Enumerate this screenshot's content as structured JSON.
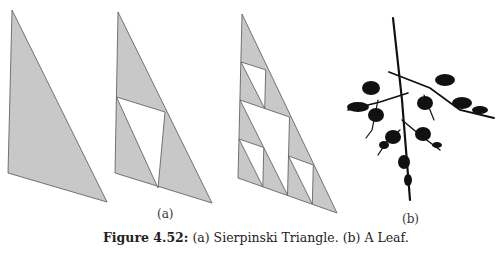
{
  "figure": {
    "number_label": "Figure 4.52:",
    "caption_text": "(a) Sierpinski Triangle. (b) A Leaf.",
    "panels": [
      {
        "label": "(a)",
        "description": "Sierpinski triangle iterations 0, 1, 2 on a right triangle",
        "iterations": [
          0,
          1,
          2
        ],
        "fill_color": "#c8c8c8",
        "hole_color": "#ffffff"
      },
      {
        "label": "(b)",
        "description": "Fractal leaf (IFS) rendered in black",
        "color": "#111111"
      }
    ]
  }
}
